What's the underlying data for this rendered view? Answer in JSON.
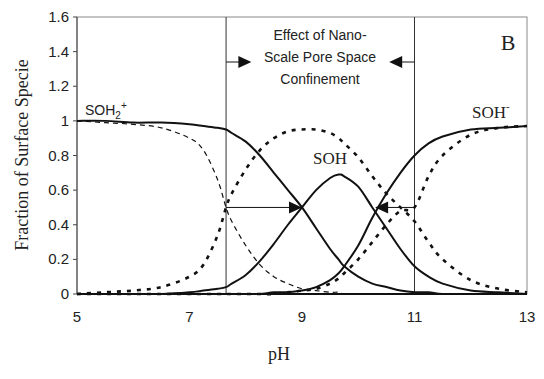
{
  "chart_data": {
    "type": "line",
    "title": "",
    "panel_label": "B",
    "xlabel": "pH",
    "ylabel": "Fraction of Surface Specie",
    "xlim": [
      5,
      13
    ],
    "ylim": [
      0,
      1.6
    ],
    "xticks": [
      5,
      7,
      9,
      11,
      13
    ],
    "yticks": [
      0,
      0.2,
      0.4,
      0.6,
      0.8,
      1,
      1.2,
      1.4,
      1.6
    ],
    "ytick_labels": [
      "0",
      "0.2",
      "0.4",
      "0.6",
      "0.8",
      "1",
      "1.2",
      "1.4",
      "1.6"
    ],
    "grid": false,
    "legend": "none (curves labeled directly)",
    "x": [
      5,
      5.5,
      6,
      6.5,
      7,
      7.25,
      7.5,
      7.65,
      7.75,
      8,
      8.25,
      8.5,
      8.75,
      9,
      9.25,
      9.5,
      9.65,
      9.75,
      10,
      10.25,
      10.5,
      10.75,
      11,
      11.25,
      11.5,
      12,
      12.5,
      13
    ],
    "series": [
      {
        "name": "SOH2+ (confined, solid)",
        "style": "solid",
        "values": [
          1.0,
          1.0,
          0.99,
          0.99,
          0.98,
          0.97,
          0.96,
          0.95,
          0.93,
          0.88,
          0.8,
          0.7,
          0.6,
          0.5,
          0.38,
          0.26,
          0.2,
          0.16,
          0.1,
          0.06,
          0.04,
          0.02,
          0.01,
          0.01,
          0.0,
          0.0,
          0.0,
          0.0
        ]
      },
      {
        "name": "SOH (confined, solid)",
        "style": "solid",
        "values": [
          0.0,
          0.0,
          0.0,
          0.0,
          0.01,
          0.02,
          0.03,
          0.04,
          0.06,
          0.11,
          0.19,
          0.29,
          0.4,
          0.5,
          0.6,
          0.67,
          0.69,
          0.68,
          0.62,
          0.5,
          0.38,
          0.26,
          0.16,
          0.1,
          0.06,
          0.02,
          0.01,
          0.0
        ]
      },
      {
        "name": "SOH- (confined, solid)",
        "style": "solid",
        "values": [
          0.0,
          0.0,
          0.0,
          0.0,
          0.0,
          0.0,
          0.0,
          0.0,
          0.0,
          0.0,
          0.0,
          0.01,
          0.01,
          0.02,
          0.04,
          0.08,
          0.12,
          0.16,
          0.28,
          0.44,
          0.58,
          0.7,
          0.8,
          0.87,
          0.91,
          0.95,
          0.96,
          0.97
        ]
      },
      {
        "name": "SOH2+ (bulk, dashed)",
        "style": "dashed",
        "values": [
          1.0,
          0.99,
          0.98,
          0.96,
          0.9,
          0.83,
          0.66,
          0.5,
          0.42,
          0.28,
          0.17,
          0.1,
          0.06,
          0.03,
          0.02,
          0.01,
          0.01,
          0.0,
          0.0,
          0.0,
          0.0,
          0.0,
          0.0,
          0.0,
          0.0,
          0.0,
          0.0,
          0.0
        ]
      },
      {
        "name": "SOH (bulk, dashed)",
        "style": "dashed",
        "values": [
          0.0,
          0.01,
          0.02,
          0.04,
          0.1,
          0.17,
          0.34,
          0.5,
          0.58,
          0.72,
          0.83,
          0.9,
          0.94,
          0.95,
          0.95,
          0.93,
          0.9,
          0.87,
          0.79,
          0.68,
          0.58,
          0.5,
          0.42,
          0.3,
          0.2,
          0.08,
          0.03,
          0.01
        ]
      },
      {
        "name": "SOH- (bulk, dashed)",
        "style": "dashed",
        "values": [
          0.0,
          0.0,
          0.0,
          0.0,
          0.0,
          0.0,
          0.0,
          0.0,
          0.0,
          0.0,
          0.0,
          0.0,
          0.01,
          0.02,
          0.03,
          0.06,
          0.09,
          0.12,
          0.2,
          0.3,
          0.4,
          0.48,
          0.5,
          0.68,
          0.8,
          0.92,
          0.96,
          0.97
        ]
      }
    ],
    "annotations": [
      {
        "text": "Effect of Nano-",
        "x": 9.35,
        "y": 1.47
      },
      {
        "text": "Scale Pore Space",
        "x": 9.35,
        "y": 1.34
      },
      {
        "text": "Confinement",
        "x": 9.35,
        "y": 1.21
      },
      {
        "text": "SOH2+",
        "x": 5.4,
        "y": 1.07
      },
      {
        "text": "SOH",
        "x": 9.4,
        "y": 0.8
      },
      {
        "text": "SOH-",
        "x": 12.3,
        "y": 1.05
      }
    ],
    "vertical_lines": [
      7.65,
      11.0
    ],
    "arrows": [
      {
        "from": [
          7.65,
          0.5
        ],
        "to": [
          9.0,
          0.5
        ],
        "label": "shift right"
      },
      {
        "from": [
          11.0,
          0.5
        ],
        "to": [
          10.3,
          0.5
        ],
        "label": "shift left"
      },
      {
        "from": [
          7.65,
          1.34
        ],
        "to": [
          8.1,
          1.34
        ]
      },
      {
        "from": [
          11.0,
          1.34
        ],
        "to": [
          10.55,
          1.34
        ]
      }
    ]
  },
  "labels": {
    "panel": "B",
    "xlabel": "pH",
    "ylabel": "Fraction of Surface Specie",
    "annot_line1": "Effect of Nano-",
    "annot_line2": "Scale Pore Space",
    "annot_line3": "Confinement",
    "soh2_base": "SOH",
    "soh2_sub": "2",
    "soh2_sup": "+",
    "soh": "SOH",
    "sohm_base": "SOH",
    "sohm_sup": "-"
  }
}
